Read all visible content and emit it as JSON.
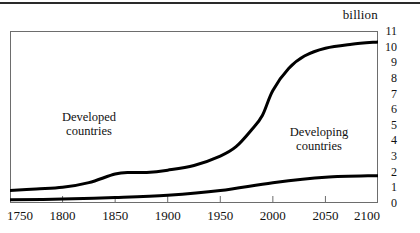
{
  "figure": {
    "unit_caption": "billion"
  },
  "chart_data": {
    "type": "line",
    "title": "",
    "subtitle": "",
    "xlabel": "",
    "ylabel": "billion",
    "unit": "billion",
    "grid": false,
    "legend_position": "inline-annotations",
    "xlim": [
      1750,
      2100
    ],
    "ylim": [
      0,
      11
    ],
    "x_ticks": [
      1750,
      1800,
      1850,
      1900,
      1950,
      2000,
      2050,
      2100
    ],
    "x_tick_labels": [
      "1750",
      "1800",
      "1850",
      "1900",
      "1950",
      "2000",
      "2050",
      "2100"
    ],
    "y_ticks": [
      0,
      1,
      2,
      3,
      4,
      5,
      6,
      7,
      8,
      9,
      10,
      11
    ],
    "y_tick_labels": [
      "0",
      "1",
      "2",
      "3",
      "4",
      "5",
      "6",
      "7",
      "8",
      "9",
      "10",
      "11"
    ],
    "x": [
      1750,
      1800,
      1850,
      1900,
      1950,
      2000,
      2050,
      2100
    ],
    "series": [
      {
        "name": "Total (world)",
        "label": "",
        "color": "#000000",
        "values": [
          0.8,
          1.0,
          1.9,
          2.1,
          3.0,
          7.2,
          9.9,
          10.3
        ],
        "detail_x": [
          1750,
          1775,
          1800,
          1825,
          1850,
          1865,
          1880,
          1900,
          1925,
          1950,
          1965,
          1980,
          1990,
          2000,
          2015,
          2030,
          2050,
          2075,
          2100
        ],
        "detail_values": [
          0.8,
          0.9,
          1.0,
          1.3,
          1.85,
          1.95,
          1.95,
          2.1,
          2.4,
          3.0,
          3.6,
          4.7,
          5.6,
          7.2,
          8.6,
          9.4,
          9.9,
          10.15,
          10.3
        ]
      },
      {
        "name": "Developed countries",
        "label": "",
        "color": "#000000",
        "values": [
          0.2,
          0.25,
          0.35,
          0.5,
          0.8,
          1.3,
          1.65,
          1.75
        ],
        "detail_x": [
          1750,
          1800,
          1850,
          1900,
          1950,
          2000,
          2050,
          2100
        ],
        "detail_values": [
          0.2,
          0.25,
          0.35,
          0.5,
          0.8,
          1.3,
          1.65,
          1.75
        ]
      }
    ],
    "annotations": [
      {
        "id": "developed",
        "line1": "Developed",
        "line2": "countries"
      },
      {
        "id": "developing",
        "line1": "Developing",
        "line2": "countries"
      }
    ]
  }
}
